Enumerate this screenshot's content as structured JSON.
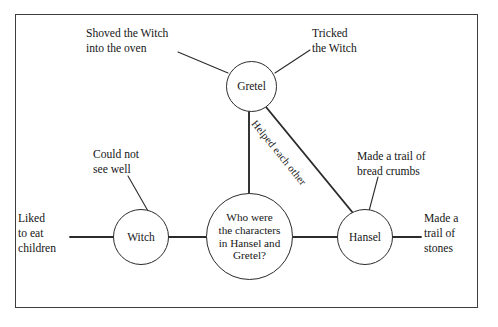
{
  "figure": {
    "kind": "semantic-web-concept-map",
    "border_color": "#3d3d3d",
    "line_color": "#2b2b2b",
    "background": "#ffffff"
  },
  "center_node": {
    "text": "Who were\nthe characters\nin Hansel and\nGretel?"
  },
  "nodes": [
    {
      "id": "gretel",
      "label": "Gretel"
    },
    {
      "id": "witch",
      "label": "Witch"
    },
    {
      "id": "hansel",
      "label": "Hansel"
    }
  ],
  "captions": [
    {
      "id": "oven",
      "text": "Shoved the Witch\ninto the oven"
    },
    {
      "id": "tricked",
      "text": "Tricked\nthe Witch"
    },
    {
      "id": "seewell",
      "text": "Could not\nsee well"
    },
    {
      "id": "liked",
      "text": "Liked\nto eat\nchildren"
    },
    {
      "id": "crumbs",
      "text": "Made a trail of\nbread crumbs"
    },
    {
      "id": "stones",
      "text": "Made a\ntrail of\nstones"
    }
  ],
  "edge_label": {
    "helped": "Helped each other"
  }
}
